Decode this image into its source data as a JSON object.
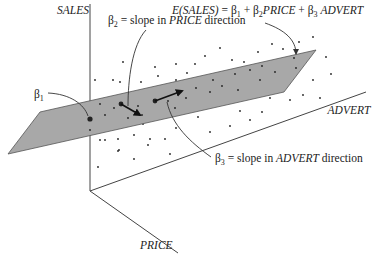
{
  "figure": {
    "type": "3d regression plane diagram",
    "axes": {
      "vertical": "SALES",
      "depth": "PRICE",
      "horizontal": "ADVERT"
    },
    "equation": {
      "lhs": "E(SALES)",
      "eq": " = ",
      "b1": "β",
      "b1_sub": "1",
      "plus1": " + ",
      "b2": "β",
      "b2_sub": "2",
      "price": "PRICE",
      "plus2": " + ",
      "b3": "β",
      "b3_sub": "3",
      "advert": " ADVERT"
    },
    "annotations": {
      "beta1": {
        "sym": "β",
        "sub": "1"
      },
      "beta2": {
        "sym": "β",
        "sub": "2",
        "eq": " = slope in ",
        "dir": "PRICE",
        "tail": " direction"
      },
      "beta3": {
        "sym": "β",
        "sub": "3",
        "eq": " = slope in ",
        "dir": "ADVERT",
        "tail": " direction"
      }
    },
    "colors": {
      "plane": "#a8a8a8",
      "lines": "#444444",
      "dots": "#222222"
    }
  }
}
